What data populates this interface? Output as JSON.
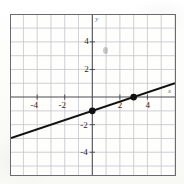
{
  "figure": {
    "kind": "coordinate-plane-line-graph",
    "background_color": "#fdfdfb",
    "border_color": "#6a6a70"
  },
  "axis_names": {
    "x": "x",
    "y": "y"
  },
  "x_tick_labels": [
    {
      "value": -4,
      "text": "-4"
    },
    {
      "value": -2,
      "text": "-2"
    },
    {
      "value": 2,
      "text": "2"
    },
    {
      "value": 4,
      "text": "4"
    }
  ],
  "y_tick_labels": [
    {
      "value": 4,
      "text": "4"
    },
    {
      "value": 2,
      "text": "2"
    },
    {
      "value": -2,
      "text": "-2"
    },
    {
      "value": -4,
      "text": "-4"
    }
  ],
  "chart_data": {
    "type": "line",
    "title": "",
    "xlabel": "x",
    "ylabel": "y",
    "xlim": [
      -5.9,
      6.0
    ],
    "ylim": [
      -5.65,
      5.95
    ],
    "grid": true,
    "grid_step": 1,
    "grid_color": "#c3c3cb",
    "axis_color": "#4a4a52",
    "legend": null,
    "series": [
      {
        "name": "line",
        "type": "line",
        "color": "#111111",
        "slope": 0.3333,
        "intercept": -1,
        "equation": "y = x/3 - 1",
        "x_intercept": 3,
        "y_intercept": -1,
        "endpoints": [
          {
            "x": -5.9,
            "y": -2.967
          },
          {
            "x": 6.0,
            "y": 1.0
          }
        ]
      }
    ],
    "points": [
      {
        "x": 0,
        "y": -1,
        "label": "",
        "color": "#111111"
      },
      {
        "x": 3,
        "y": 0,
        "label": "",
        "color": "#111111"
      }
    ]
  }
}
